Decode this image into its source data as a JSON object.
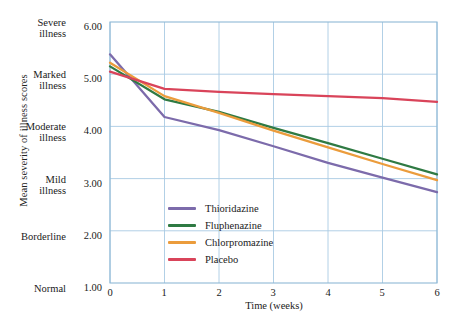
{
  "chart_data": {
    "type": "line",
    "title": "",
    "xlabel": "Time (weeks)",
    "ylabel": "Mean severity of illness scores",
    "x": [
      0,
      1,
      2,
      3,
      4,
      5,
      6
    ],
    "xlim": [
      0,
      6
    ],
    "ylim": [
      1.0,
      6.0
    ],
    "grid": true,
    "legend_position": "inside-lower-left",
    "x_ticks": [
      "0",
      "1",
      "2",
      "3",
      "4",
      "5",
      "6"
    ],
    "y_ticks": [
      {
        "value": "6.00",
        "category": "Severe",
        "category2": "illness"
      },
      {
        "value": "5.00",
        "category": "Marked",
        "category2": "illness"
      },
      {
        "value": "4.00",
        "category": "Moderate",
        "category2": "illness"
      },
      {
        "value": "3.00",
        "category": "Mild",
        "category2": "illness"
      },
      {
        "value": "2.00",
        "category": "Borderline",
        "category2": ""
      },
      {
        "value": "1.00",
        "category": "Normal",
        "category2": ""
      }
    ],
    "series": [
      {
        "name": "Thioridazine",
        "color": "#7c6bab",
        "values": [
          5.38,
          4.18,
          3.93,
          3.62,
          3.3,
          3.02,
          2.74
        ]
      },
      {
        "name": "Fluphenazine",
        "color": "#2f7a43",
        "values": [
          5.15,
          4.52,
          4.28,
          3.97,
          3.68,
          3.38,
          3.08
        ]
      },
      {
        "name": "Chlorpromazine",
        "color": "#eb9c3c",
        "values": [
          5.22,
          4.58,
          4.26,
          3.92,
          3.6,
          3.28,
          2.97
        ]
      },
      {
        "name": "Placebo",
        "color": "#d9445a",
        "values": [
          5.05,
          4.72,
          4.66,
          4.62,
          4.58,
          4.54,
          4.47
        ]
      }
    ]
  },
  "axes": {
    "grid_color": "#a9cbe3",
    "frame_color": "#8fb8d6"
  }
}
